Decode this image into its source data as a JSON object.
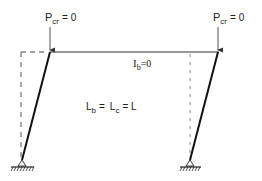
{
  "diagram": {
    "colors": {
      "stroke": "#1a1a1a",
      "dashed": "#555555",
      "text": "#222222",
      "background": "#ffffff"
    },
    "loads": [
      {
        "id": "left",
        "symbol": "P",
        "subscript": "cr",
        "rhs": "= 0"
      },
      {
        "id": "right",
        "symbol": "P",
        "subscript": "cr",
        "rhs": "= 0"
      }
    ],
    "beam_label": {
      "symbol": "I",
      "subscript": "b",
      "rhs": "=0"
    },
    "length_label": {
      "part1_symbol": "L",
      "part1_sub": "b",
      "eq1": "=",
      "part2_symbol": "L",
      "part2_sub": "c",
      "eq2": "= L"
    },
    "supports": [
      "pinned",
      "pinned"
    ],
    "elements": [
      "left-column",
      "beam",
      "right-column",
      "left-original-position",
      "right-original-position"
    ]
  }
}
